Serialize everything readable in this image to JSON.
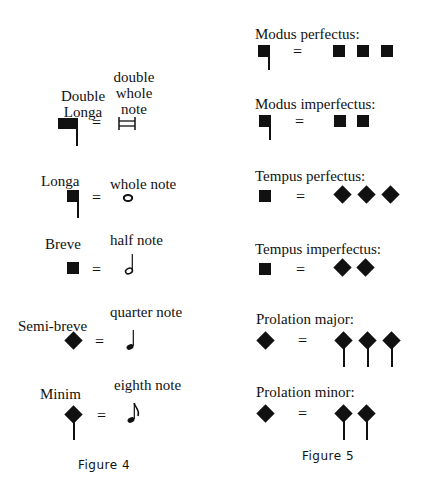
{
  "figure4": {
    "caption": "Figure 4",
    "rows": [
      {
        "name_line1": "Double",
        "name_line2": "Longa",
        "equals": "=",
        "modern_line1": "double",
        "modern_line2": "whole",
        "modern_line3": "note",
        "symbol": "double-longa",
        "modern_symbol": "double-whole-note"
      },
      {
        "name": "Longa",
        "equals": "=",
        "modern": "whole note",
        "symbol": "longa",
        "modern_symbol": "whole-note"
      },
      {
        "name": "Breve",
        "equals": "=",
        "modern": "half note",
        "symbol": "breve",
        "modern_symbol": "half-note"
      },
      {
        "name": "Semi-breve",
        "equals": "=",
        "modern": "quarter note",
        "symbol": "semibreve",
        "modern_symbol": "quarter-note"
      },
      {
        "name": "Minim",
        "equals": "=",
        "modern": "eighth note",
        "symbol": "minim",
        "modern_symbol": "eighth-note"
      }
    ]
  },
  "figure5": {
    "caption": "Figure 5",
    "rows": [
      {
        "label": "Modus perfectus:",
        "equals": "=",
        "count": 3
      },
      {
        "label": "Modus imperfectus:",
        "equals": "=",
        "count": 2
      },
      {
        "label": "Tempus perfectus:",
        "equals": "=",
        "count": 3
      },
      {
        "label": "Tempus imperfectus:",
        "equals": "=",
        "count": 2
      },
      {
        "label": "Prolation major:",
        "equals": "=",
        "count": 3
      },
      {
        "label": "Prolation minor:",
        "equals": "=",
        "count": 2
      }
    ]
  }
}
